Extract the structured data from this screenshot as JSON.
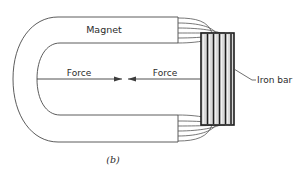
{
  "figure": {
    "caption": "(b)",
    "background_color": "#ffffff",
    "line_color": "#4a4a4a",
    "bar_fill_color": "#d9d9d9",
    "bar_edge_color": "#1d1d1d"
  },
  "labels": {
    "magnet": "Magnet",
    "force_left": "Force",
    "force_right": "Force",
    "iron_bar": "Iron bar"
  },
  "diagram": {
    "type": "physics-schematic",
    "magnet": {
      "shape": "horseshoe-u",
      "opening_direction": "right",
      "outer_left_x": 13,
      "inner_left_x": 37,
      "top_arm_top_y": 17,
      "top_arm_bottom_y": 43,
      "bottom_arm_top_y": 115,
      "bottom_arm_bottom_y": 142,
      "pole_face_x": 178,
      "center_axis_y": 79
    },
    "iron_bar": {
      "x": 201,
      "y": 33,
      "width": 33,
      "height": 92,
      "stripe_count": 5,
      "orientation": "vertical"
    },
    "field_lines": {
      "count_per_pole": 5,
      "poles": [
        "top",
        "bottom"
      ]
    },
    "force_arrows": {
      "count": 2,
      "direction": "toward-center",
      "axis_y": 79,
      "left_arrow_tip_x": 122,
      "right_arrow_tip_x": 128
    }
  }
}
